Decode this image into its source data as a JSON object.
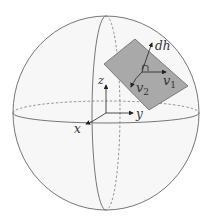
{
  "diagram": {
    "colors": {
      "sphere_fill": "#f6f6f6",
      "line": "#555555",
      "plane_fill": "#a9a9a9",
      "plane_stroke": "#666666",
      "arrow": "#222222"
    },
    "labels": {
      "dh": "dh",
      "v1": "v",
      "v1_sub": "1",
      "v2": "v",
      "v2_sub": "2",
      "x": "x",
      "y": "y",
      "z": "z"
    }
  }
}
